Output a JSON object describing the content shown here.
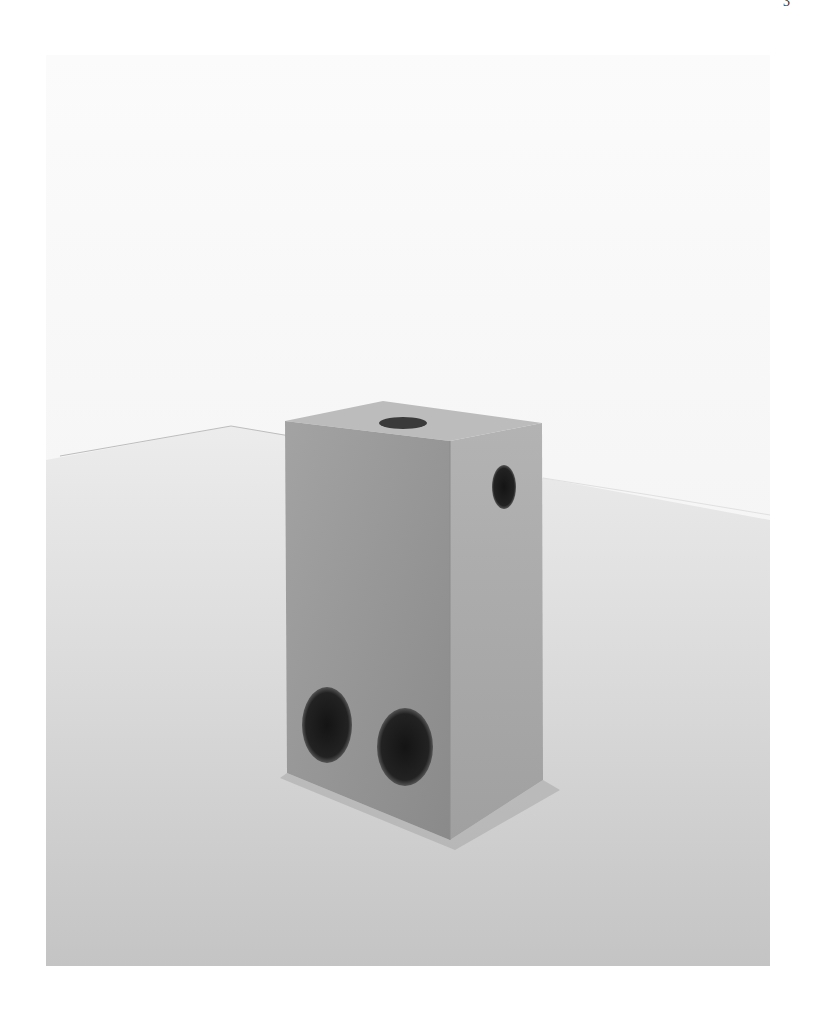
{
  "page": {
    "number": "3"
  },
  "photo": {
    "subject": "concrete block sculpture with holes on white gallery floor",
    "colors": {
      "wall": "#f7f7f7",
      "floor": "#dcdcdc",
      "block_front": "#9a9a9a",
      "block_side": "#a8a8a8",
      "block_top": "#bdbdbd",
      "hole": "#1a1a1a"
    }
  }
}
